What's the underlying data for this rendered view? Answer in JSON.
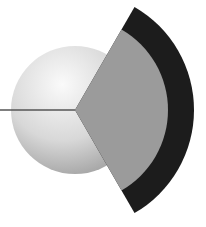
{
  "diagram": {
    "type": "sphere-cutaway-cross-section",
    "canvas": {
      "width": 206,
      "height": 227
    },
    "center": {
      "x": 75,
      "y": 110
    },
    "sphere": {
      "radius": 64,
      "highlight_color": "#fafafa",
      "mid_color": "#d8d8d8",
      "shadow_color": "#9a9a9a"
    },
    "wedge": {
      "start_angle_deg": -60,
      "end_angle_deg": 60
    },
    "layers": [
      {
        "name": "inner-layer",
        "radius": 93,
        "color": "#9b9b9b"
      },
      {
        "name": "outer-layer",
        "radius": 119,
        "color": "#1c1c1c"
      }
    ],
    "pointer_line": {
      "x1": 0,
      "y1": 110,
      "x2": 75,
      "y2": 110,
      "color": "#555555",
      "width": 1.6
    }
  }
}
